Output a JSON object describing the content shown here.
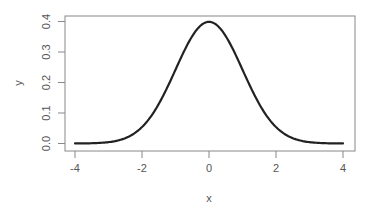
{
  "chart_data": {
    "type": "line",
    "title": "",
    "xlabel": "x",
    "ylabel": "y",
    "xlim": [
      -4.24,
      4.24
    ],
    "ylim": [
      -0.016,
      0.415
    ],
    "x_ticks": [
      -4,
      -2,
      0,
      2,
      4
    ],
    "x_tick_labels": [
      "-4",
      "-2",
      "0",
      "2",
      "4"
    ],
    "y_ticks": [
      0.0,
      0.1,
      0.2,
      0.3,
      0.4
    ],
    "y_tick_labels": [
      "0.0",
      "0.1",
      "0.2",
      "0.3",
      "0.4"
    ],
    "grid": false,
    "legend": null,
    "series": [
      {
        "name": "dnorm(x)",
        "function": "standard normal density",
        "x": [
          -4,
          -3.5,
          -3,
          -2.5,
          -2,
          -1.5,
          -1,
          -0.5,
          0,
          0.5,
          1,
          1.5,
          2,
          2.5,
          3,
          3.5,
          4
        ],
        "values": [
          0.0001,
          0.0009,
          0.0044,
          0.0175,
          0.054,
          0.1295,
          0.242,
          0.3521,
          0.3989,
          0.3521,
          0.242,
          0.1295,
          0.054,
          0.0175,
          0.0044,
          0.0009,
          0.0001
        ],
        "color": "#222222"
      }
    ]
  },
  "colors": {
    "axis": "#888888",
    "text": "#555555",
    "line": "#222222"
  }
}
